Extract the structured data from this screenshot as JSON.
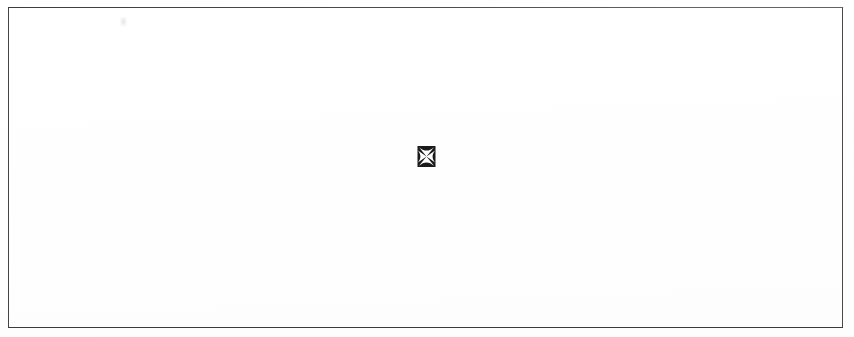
{
  "page": {
    "background_color": "#fefefe",
    "width": 854,
    "height": 337,
    "body_text": ""
  },
  "frame": {
    "name": "page-border-rule",
    "color": "#4a4a4a",
    "thickness_px": 1,
    "inset_left_px": 8,
    "inset_top_px": 7,
    "width_px": 835,
    "height_px": 321,
    "label": ""
  },
  "glyph": {
    "icon_name": "cross-pattee-icon",
    "character": "✠",
    "description": "cross pattée",
    "foreground_color": "#1a1a1a",
    "cross_color": "#ffffff",
    "x_px": 417,
    "y_px": 146,
    "width_px": 19,
    "height_px": 21,
    "caption": ""
  },
  "artifact": {
    "name": "scan-smudge",
    "color": "#cdcdcd",
    "x_px": 120,
    "y_px": 17,
    "note": ""
  }
}
